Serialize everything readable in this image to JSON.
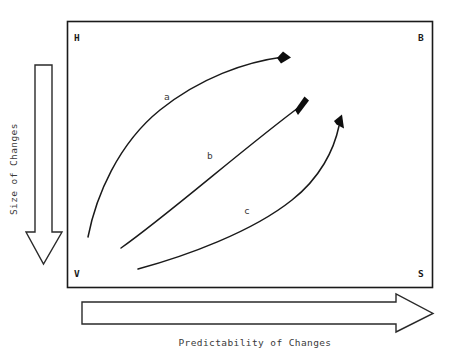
{
  "diagram": {
    "frame": {
      "corners": {
        "top_left": "H",
        "top_right": "B",
        "bottom_left": "V",
        "bottom_right": "S"
      }
    },
    "axes": {
      "vertical": {
        "label": "Size of Changes",
        "icon": "down-arrow-icon",
        "direction": "down"
      },
      "horizontal": {
        "label": "Predictability of Changes",
        "icon": "right-arrow-icon",
        "direction": "right"
      }
    },
    "curves": [
      {
        "id": "curve-a",
        "label": "a",
        "label_x": 164,
        "label_y": 100,
        "path": "M 88 237 C 96 196 118 144 160 110 C 200 78 245 62 283 57",
        "head": "M 283.0 51.5 L 291.0 57.6 L 281.0 63.6 L 277.0 58.0 Z"
      },
      {
        "id": "curve-b",
        "label": "b",
        "label_x": 207,
        "label_y": 159,
        "path": "M 121 248 C 168 215 245 147 302 105",
        "head": "M 304.5 96.5 L 309.0 100.5 L 298.0 115.0 L 295.0 110.0 Z"
      },
      {
        "id": "curve-c",
        "label": "c",
        "label_x": 244,
        "label_y": 214,
        "path": "M 138 269 C 186 256 252 232 292 200 C 320 178 334 150 339 126",
        "head": "M 342.0 114.5 L 344.0 128.5 L 336.5 124.5 L 334.0 121.0 Z"
      }
    ],
    "colors": {
      "line": "#1a1a1a",
      "text": "#3a3a3a",
      "arrow_outline": "#2a2a2a",
      "background": "#ffffff"
    }
  }
}
